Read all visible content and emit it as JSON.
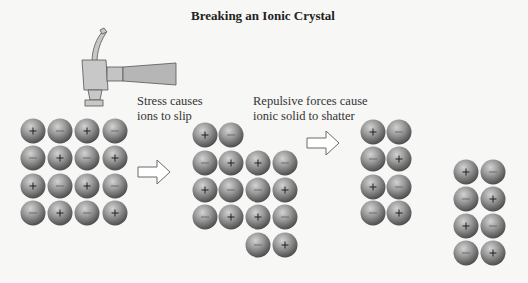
{
  "title": "Breaking an Ionic Crystal",
  "captions": {
    "stress": [
      "Stress causes",
      "ions to slip"
    ],
    "repulsive": [
      "Repulsive forces cause",
      "ionic solid to shatter"
    ]
  },
  "colors": {
    "background": "#f7f7f5",
    "ion_light": "#c4c4c4",
    "ion_mid": "#8e8e8e",
    "ion_dark": "#4f4f4f",
    "hammer_head": "#c8c8c8",
    "hammer_handle": "#b4b4b4",
    "arrow_fill": "#ffffff",
    "arrow_stroke": "#6a6a6a"
  },
  "ion_radius": 12.5,
  "stages": [
    {
      "name": "intact-crystal",
      "ions": [
        {
          "x": 33,
          "y": 131,
          "s": "+"
        },
        {
          "x": 60,
          "y": 131,
          "s": "-"
        },
        {
          "x": 87,
          "y": 131,
          "s": "+"
        },
        {
          "x": 115,
          "y": 131,
          "s": "-"
        },
        {
          "x": 33,
          "y": 158,
          "s": "-"
        },
        {
          "x": 60,
          "y": 158,
          "s": "+"
        },
        {
          "x": 87,
          "y": 158,
          "s": "-"
        },
        {
          "x": 115,
          "y": 158,
          "s": "+"
        },
        {
          "x": 33,
          "y": 186,
          "s": "+"
        },
        {
          "x": 60,
          "y": 186,
          "s": "-"
        },
        {
          "x": 87,
          "y": 186,
          "s": "+"
        },
        {
          "x": 115,
          "y": 186,
          "s": "-"
        },
        {
          "x": 33,
          "y": 213,
          "s": "-"
        },
        {
          "x": 60,
          "y": 213,
          "s": "+"
        },
        {
          "x": 87,
          "y": 213,
          "s": "-"
        },
        {
          "x": 115,
          "y": 213,
          "s": "+"
        }
      ]
    },
    {
      "name": "slipped-crystal",
      "ions": [
        {
          "x": 205,
          "y": 135,
          "s": "+"
        },
        {
          "x": 231,
          "y": 135,
          "s": "-"
        },
        {
          "x": 205,
          "y": 163,
          "s": "-"
        },
        {
          "x": 231,
          "y": 163,
          "s": "+"
        },
        {
          "x": 258,
          "y": 163,
          "s": "+"
        },
        {
          "x": 285,
          "y": 163,
          "s": "-"
        },
        {
          "x": 205,
          "y": 190,
          "s": "+"
        },
        {
          "x": 231,
          "y": 190,
          "s": "-"
        },
        {
          "x": 258,
          "y": 190,
          "s": "-"
        },
        {
          "x": 285,
          "y": 190,
          "s": "+"
        },
        {
          "x": 205,
          "y": 217,
          "s": "-"
        },
        {
          "x": 231,
          "y": 217,
          "s": "+"
        },
        {
          "x": 258,
          "y": 217,
          "s": "+"
        },
        {
          "x": 285,
          "y": 217,
          "s": "-"
        },
        {
          "x": 258,
          "y": 245,
          "s": "-"
        },
        {
          "x": 285,
          "y": 245,
          "s": "+"
        }
      ]
    },
    {
      "name": "shattered-fragment-1",
      "ions": [
        {
          "x": 373,
          "y": 132,
          "s": "+"
        },
        {
          "x": 399,
          "y": 132,
          "s": "-"
        },
        {
          "x": 373,
          "y": 159,
          "s": "-"
        },
        {
          "x": 399,
          "y": 159,
          "s": "+"
        },
        {
          "x": 373,
          "y": 187,
          "s": "+"
        },
        {
          "x": 399,
          "y": 187,
          "s": "-"
        },
        {
          "x": 373,
          "y": 213,
          "s": "-"
        },
        {
          "x": 399,
          "y": 213,
          "s": "+"
        }
      ]
    },
    {
      "name": "shattered-fragment-2",
      "ions": [
        {
          "x": 466,
          "y": 172,
          "s": "+"
        },
        {
          "x": 493,
          "y": 172,
          "s": "-"
        },
        {
          "x": 466,
          "y": 199,
          "s": "-"
        },
        {
          "x": 493,
          "y": 199,
          "s": "+"
        },
        {
          "x": 466,
          "y": 226,
          "s": "+"
        },
        {
          "x": 493,
          "y": 226,
          "s": "-"
        },
        {
          "x": 466,
          "y": 253,
          "s": "-"
        },
        {
          "x": 493,
          "y": 253,
          "s": "+"
        }
      ]
    }
  ],
  "arrows": [
    {
      "name": "arrow-slip",
      "x": 138,
      "y": 160,
      "w": 32,
      "h": 24
    },
    {
      "name": "arrow-shatter",
      "x": 307,
      "y": 131,
      "w": 32,
      "h": 24
    }
  ],
  "icons": {
    "hammer": "hammer-icon",
    "arrow": "right-arrow-icon",
    "cation": "plus-sign",
    "anion": "minus-sign"
  }
}
